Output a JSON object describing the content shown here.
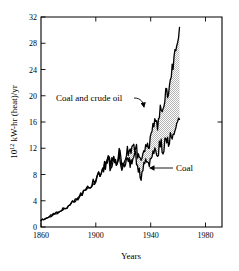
{
  "figure": {
    "background_color": "#ffffff",
    "ink_color": "#000000",
    "fill_color": "#c8c8c8"
  },
  "chart_data": {
    "type": "area",
    "title": "",
    "subtitle": "",
    "xlabel": "Years",
    "ylabel": "10^12 kW-hr (heat)/yr",
    "ylabel_parts": {
      "base": "10",
      "exponent": "12",
      "rest": "kW-hr (heat)/yr"
    },
    "xlim": [
      1860,
      1992
    ],
    "ylim": [
      0,
      32
    ],
    "grid": false,
    "legend_position": "inline-annotations",
    "xticks": [
      1860,
      1900,
      1940,
      1980
    ],
    "xtick_labels": [
      "1860",
      "1900",
      "1940",
      "1980"
    ],
    "yticks": [
      0,
      4,
      8,
      12,
      16,
      20,
      24,
      28,
      32
    ],
    "ytick_labels": [
      "0",
      "4",
      "8",
      "12",
      "16",
      "20",
      "24",
      "28",
      "32"
    ],
    "annotations": [
      {
        "name": "coal-and-crude-oil",
        "text": "Coal and crude oil",
        "points_to_series": "Coal and crude oil",
        "arrow_style": "curved"
      },
      {
        "name": "coal",
        "text": "Coal",
        "points_to_series": "Coal",
        "arrow_style": "straight-left"
      }
    ],
    "series": [
      {
        "name": "Coal and crude oil",
        "fill_between_with": "Coal",
        "x": [
          1860,
          1863,
          1866,
          1869,
          1872,
          1875,
          1878,
          1881,
          1884,
          1887,
          1890,
          1893,
          1896,
          1899,
          1902,
          1905,
          1907,
          1909,
          1911,
          1913,
          1915,
          1917,
          1919,
          1921,
          1923,
          1925,
          1927,
          1929,
          1931,
          1933,
          1935,
          1937,
          1939,
          1941,
          1943,
          1945,
          1947,
          1949,
          1951,
          1953,
          1955,
          1957,
          1959,
          1961
        ],
        "values": [
          1.0,
          1.3,
          1.6,
          1.9,
          2.2,
          2.6,
          3.0,
          3.4,
          3.9,
          4.4,
          5.0,
          5.6,
          6.3,
          7.1,
          8.0,
          9.0,
          9.6,
          10.2,
          9.6,
          10.6,
          10.1,
          11.2,
          9.9,
          10.7,
          11.8,
          11.2,
          11.6,
          12.6,
          10.4,
          9.8,
          11.3,
          12.5,
          12.2,
          14.9,
          16.2,
          15.2,
          18.2,
          17.4,
          20.6,
          20.2,
          23.3,
          25.6,
          27.6,
          30.4
        ]
      },
      {
        "name": "Coal",
        "x": [
          1860,
          1863,
          1866,
          1869,
          1872,
          1875,
          1878,
          1881,
          1884,
          1887,
          1890,
          1893,
          1896,
          1899,
          1902,
          1905,
          1907,
          1909,
          1911,
          1913,
          1915,
          1917,
          1919,
          1921,
          1923,
          1925,
          1927,
          1929,
          1931,
          1933,
          1935,
          1937,
          1939,
          1941,
          1943,
          1945,
          1947,
          1949,
          1951,
          1953,
          1955,
          1957,
          1959,
          1961
        ],
        "values": [
          1.0,
          1.3,
          1.6,
          1.9,
          2.2,
          2.6,
          3.0,
          3.4,
          3.9,
          4.4,
          5.0,
          5.6,
          6.3,
          7.1,
          7.9,
          8.8,
          9.3,
          9.9,
          9.2,
          10.1,
          9.5,
          10.5,
          9.1,
          9.8,
          10.6,
          9.9,
          10.2,
          10.9,
          8.6,
          7.9,
          9.1,
          10.0,
          9.6,
          11.4,
          12.1,
          11.0,
          12.8,
          11.8,
          13.4,
          12.6,
          14.1,
          14.8,
          15.3,
          16.4
        ]
      }
    ]
  }
}
